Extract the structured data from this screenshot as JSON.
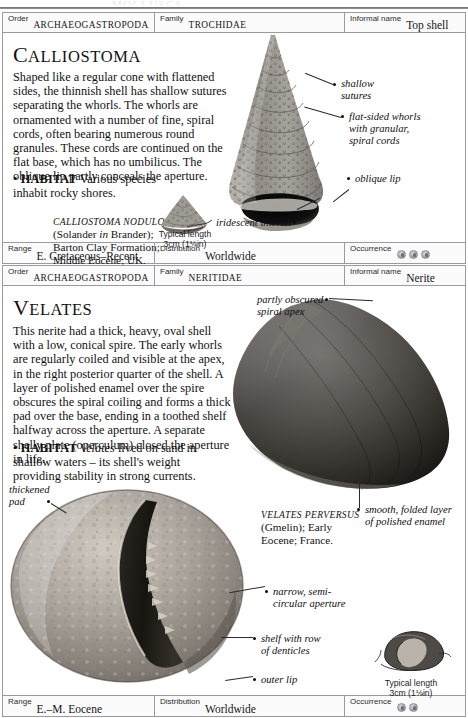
{
  "page": {
    "running_head": "MOLLUSCS"
  },
  "entries": [
    {
      "header": {
        "order_label": "Order",
        "order_value": "Archaeogastropoda",
        "family_label": "Family",
        "family_value": "Trochidae",
        "informal_label": "Informal name",
        "informal_value": "Top shell"
      },
      "genus_first": "C",
      "genus_rest": "ALLIOSTOMA",
      "description": "Shaped like a regular cone with flattened sides, the thinnish shell has shallow sutures separating the whorls. The whorls are ornamented with a number of fine, spiral cords, often bearing numerous round granules. These cords are continued on the flat base, which has no umbilicus. The oblique lip partly conceals the aperture.",
      "habitat_bullet": "•",
      "habitat_label": "HABITAT",
      "habitat_text": "Various species inhabit rocky shores.",
      "specimen": {
        "sci_name": "Calliostoma nodulosum",
        "authority_pre": "(Solander ",
        "authority_italic": "in",
        "authority_post": " Brander);",
        "formation": "Barton Clay Formation;",
        "age_locality": "Middle Eocene; UK."
      },
      "typical_length": {
        "line1": "Typical length",
        "line2": "3cm (1⅛in)"
      },
      "annotations": [
        {
          "name": "shallow-sutures",
          "text": "shallow\nsutures"
        },
        {
          "name": "flat-sided-whorls",
          "text": "flat-sided whorls\nwith granular,\nspiral cords"
        },
        {
          "name": "oblique-lip",
          "text": "oblique lip"
        },
        {
          "name": "iridescent-interior",
          "text": "iridescent interior"
        }
      ],
      "footer": {
        "range_label": "Range",
        "range_value": "E. Cretaceous–Recent",
        "distribution_label": "Distribution",
        "distribution_value": "Worldwide",
        "occurrence_label": "Occurrence",
        "occurrence_count": 3
      }
    },
    {
      "header": {
        "order_label": "Order",
        "order_value": "Archaeogastropoda",
        "family_label": "Family",
        "family_value": "Neritidae",
        "informal_label": "Informal name",
        "informal_value": "Nerite"
      },
      "genus_first": "V",
      "genus_rest": "ELATES",
      "description": "This nerite had a thick, heavy, oval shell with a low, conical spire. The early whorls are regularly coiled and visible at the apex, in the right posterior quarter of the shell. A layer of polished enamel over the spire obscures the spiral coiling and forms a thick pad over the base, ending in a toothed shelf halfway across the aperture. A separate shelly plate (operculum) closed the aperture in life.",
      "habitat_bullet": "•",
      "habitat_label": "HABITAT",
      "habitat_italic": "Velates",
      "habitat_text": " lived on sand in shallow waters – its shell's weight providing stability in strong currents.",
      "specimen": {
        "sci_name": "Velates perversus",
        "authority": "(Gmelin); Early",
        "age_locality": "Eocene; France."
      },
      "typical_length": {
        "line1": "Typical length",
        "line2": "3cm (1⅛in)"
      },
      "annotations": [
        {
          "name": "partly-obscured-spiral-apex",
          "text": "partly obscured\nspiral apex"
        },
        {
          "name": "thickened-pad",
          "text": "thickened\npad"
        },
        {
          "name": "smooth-folded-layer",
          "text": "smooth, folded layer\nof polished enamel"
        },
        {
          "name": "narrow-semicircular-aperture",
          "text": "narrow, semi-\ncircular aperture"
        },
        {
          "name": "shelf-with-denticles",
          "text": "shelf with row\nof denticles"
        },
        {
          "name": "outer-lip",
          "text": "outer lip"
        }
      ],
      "footer": {
        "range_label": "Range",
        "range_value": "E.–M. Eocene",
        "distribution_label": "Distribution",
        "distribution_value": "Worldwide",
        "occurrence_label": "Occurrence",
        "occurrence_count": 2
      }
    }
  ],
  "colors": {
    "rule": "#9a9aa0",
    "text": "#121212",
    "badge": "#a8a8ae"
  }
}
